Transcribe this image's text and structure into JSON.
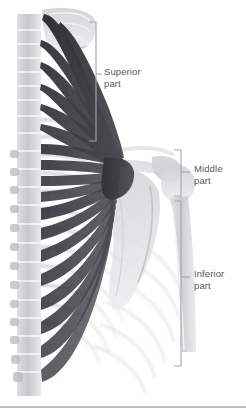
{
  "figure": {
    "view": "posterior",
    "background_color": "#ffffff",
    "muscle_color": "#3f3f45",
    "bone_color": "#c9c9cc",
    "label_color": "#56575a",
    "bracket_color": "#a7a7aa"
  },
  "labels": {
    "superior": "Superior\npart",
    "middle": "Middle\npart",
    "inferior": "Inferior\npart"
  },
  "brackets": [
    {
      "name": "superior",
      "x": 96,
      "top": 22,
      "bottom": 141,
      "tick_y": 74
    },
    {
      "name": "middle",
      "x": 181,
      "top": 150,
      "bottom": 196,
      "tick_y": 172
    },
    {
      "name": "inferior",
      "x": 181,
      "top": 201,
      "bottom": 366,
      "tick_y": 277
    }
  ],
  "anatomy": {
    "structures": [
      "occipital-bone",
      "cervical-vertebrae",
      "thoracic-vertebrae",
      "ribs",
      "scapula",
      "acromion",
      "humerus",
      "clavicle",
      "trapezius-fibers"
    ]
  }
}
